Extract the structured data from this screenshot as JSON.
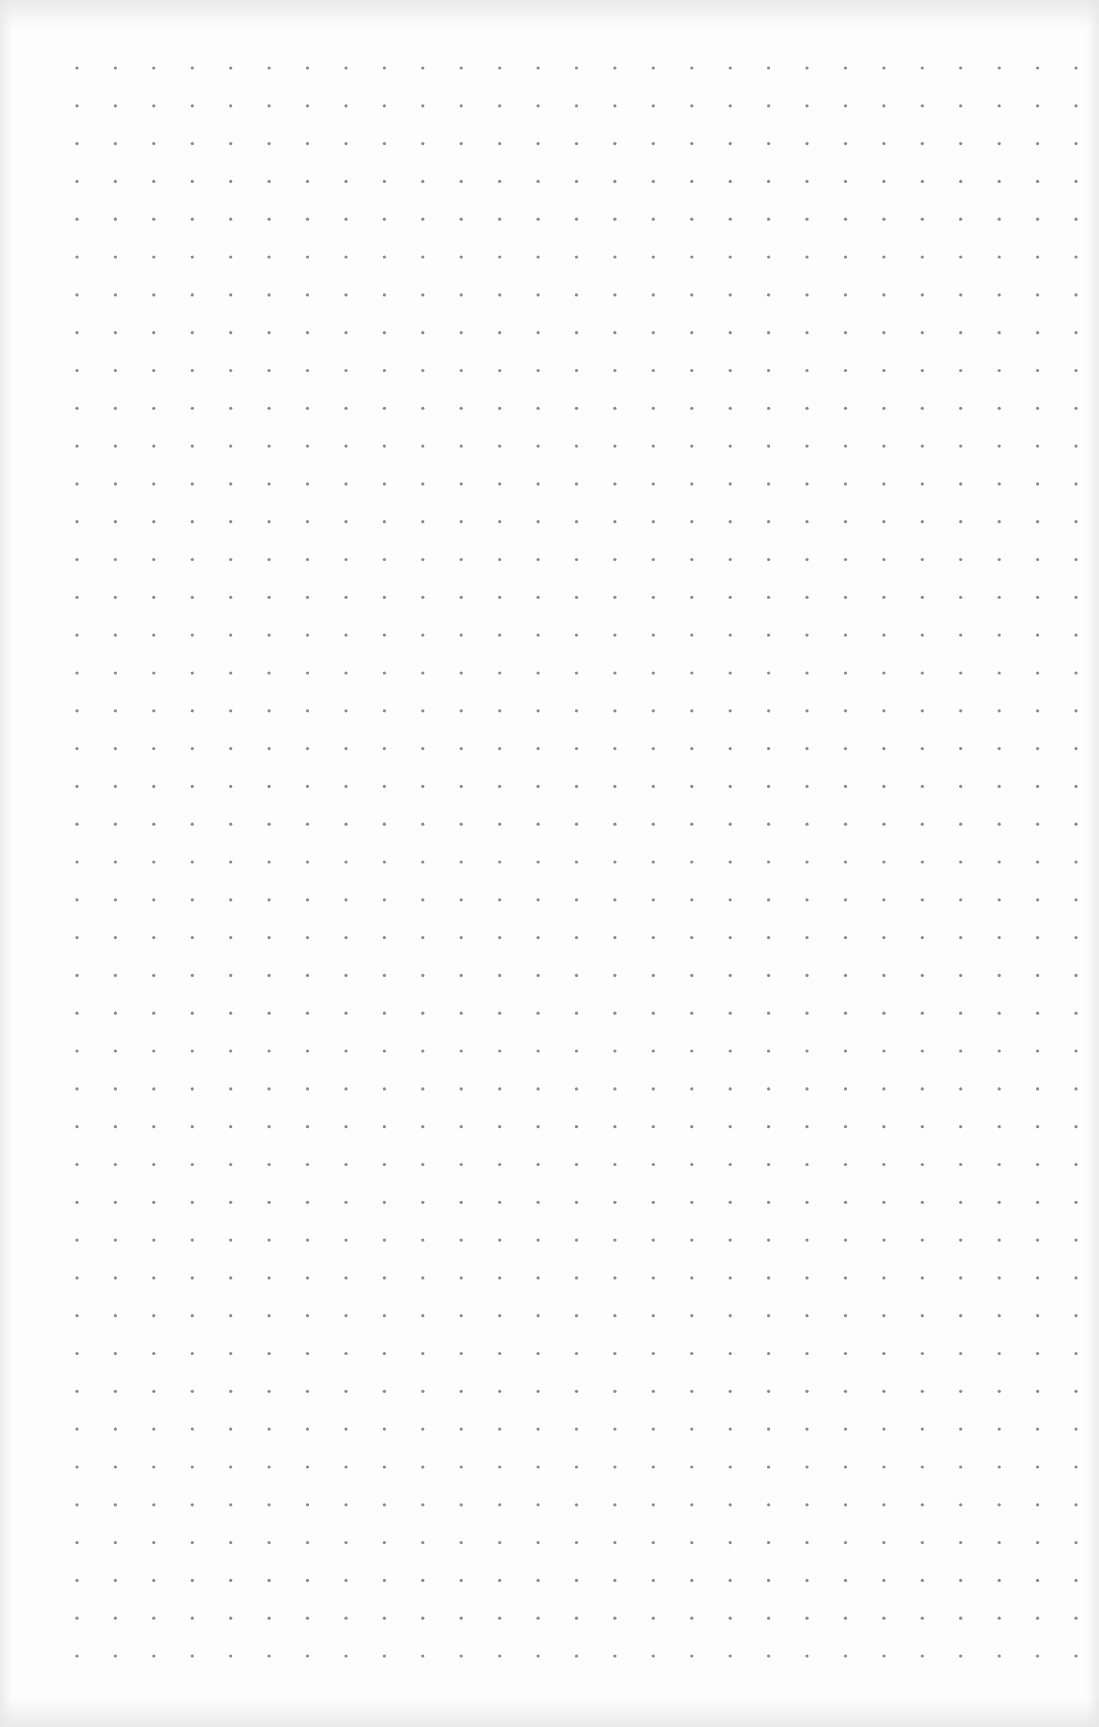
{
  "document": {
    "type": "dot-grid-paper",
    "dot_color": "#8a8a8a",
    "paper_color": "#fdfdfd",
    "grid": {
      "columns": 27,
      "rows": 43
    },
    "text": []
  }
}
